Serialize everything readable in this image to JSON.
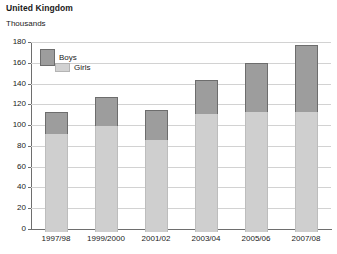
{
  "chart_data": {
    "type": "bar",
    "title": "United Kingdom",
    "subtitle": "Thousands",
    "xlabel": "",
    "ylabel": "Thousands",
    "stacked": true,
    "grid": true,
    "legend_position": "top-left inside plot",
    "ylim": [
      0,
      180
    ],
    "yticks": [
      0,
      20,
      40,
      60,
      80,
      100,
      120,
      140,
      160,
      180
    ],
    "ytick_labels": [
      "0",
      "20",
      "40",
      "60",
      "80",
      "100",
      "120",
      "140",
      "160",
      "180"
    ],
    "categories": [
      "1997/98",
      "1999/2000",
      "2001/02",
      "2003/04",
      "2005/06",
      "2007/08"
    ],
    "series": [
      {
        "name": "Girls",
        "color": "#cfcfcf",
        "values": [
          91,
          99,
          86,
          111,
          113,
          113
        ]
      },
      {
        "name": "Boys",
        "color": "#9d9d9d",
        "values": [
          22,
          28,
          29,
          32,
          47,
          64
        ]
      }
    ],
    "totals": [
      113,
      127,
      115,
      143,
      160,
      177
    ]
  },
  "legend": {
    "items": [
      {
        "label": "Boys",
        "swatch": "boys-swatch"
      },
      {
        "label": "Girls",
        "swatch": "girls-swatch"
      }
    ]
  }
}
